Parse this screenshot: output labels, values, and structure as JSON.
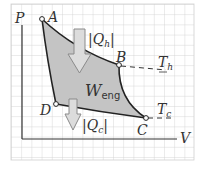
{
  "diagram": {
    "type": "PV diagram (Carnot cycle)",
    "axes": {
      "y_label": "P",
      "x_label": "V"
    },
    "points": [
      {
        "name": "A",
        "x": 42,
        "y": 19
      },
      {
        "name": "B",
        "x": 119,
        "y": 65
      },
      {
        "name": "C",
        "x": 146,
        "y": 118
      },
      {
        "name": "D",
        "x": 56,
        "y": 104
      }
    ],
    "labels": {
      "A": "A",
      "B": "B",
      "C": "C",
      "D": "D",
      "Qh": "|Q",
      "Qh_sub": "h",
      "Qc": "|Q",
      "Qc_sub": "c",
      "W": "W",
      "W_sub": "eng",
      "Th": "T",
      "Th_sub": "h",
      "Tc": "T",
      "Tc_sub": "c"
    },
    "colors": {
      "grid": "#c8c8c8",
      "axis": "#333333",
      "fill": "#c4c4c4",
      "curve": "#222222",
      "arrow_fill": "#d8d8d8",
      "arrow_stroke": "#888888"
    }
  }
}
